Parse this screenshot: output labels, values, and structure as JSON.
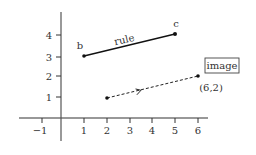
{
  "diagram": {
    "axes": {
      "x_ticks": [
        {
          "value": -1,
          "label": "−1"
        },
        {
          "value": 1,
          "label": "1"
        },
        {
          "value": 2,
          "label": "2"
        },
        {
          "value": 3,
          "label": "3"
        },
        {
          "value": 4,
          "label": "4"
        },
        {
          "value": 5,
          "label": "5"
        },
        {
          "value": 6,
          "label": "6"
        }
      ],
      "y_ticks": [
        {
          "value": 1,
          "label": "1"
        },
        {
          "value": 2,
          "label": "2"
        },
        {
          "value": 3,
          "label": "3"
        },
        {
          "value": 4,
          "label": "4"
        }
      ]
    },
    "points": {
      "b": {
        "label": "b",
        "x": 1,
        "y": 3
      },
      "c": {
        "label": "c",
        "x": 5,
        "y": 4
      },
      "start": {
        "x": 2,
        "y": 1
      },
      "end": {
        "label": "(6,2)",
        "x": 6,
        "y": 2
      }
    },
    "rule_label": "rule",
    "image_label": "image",
    "colors": {
      "line": "#222222",
      "text": "#333333",
      "axis": "#333333"
    }
  }
}
